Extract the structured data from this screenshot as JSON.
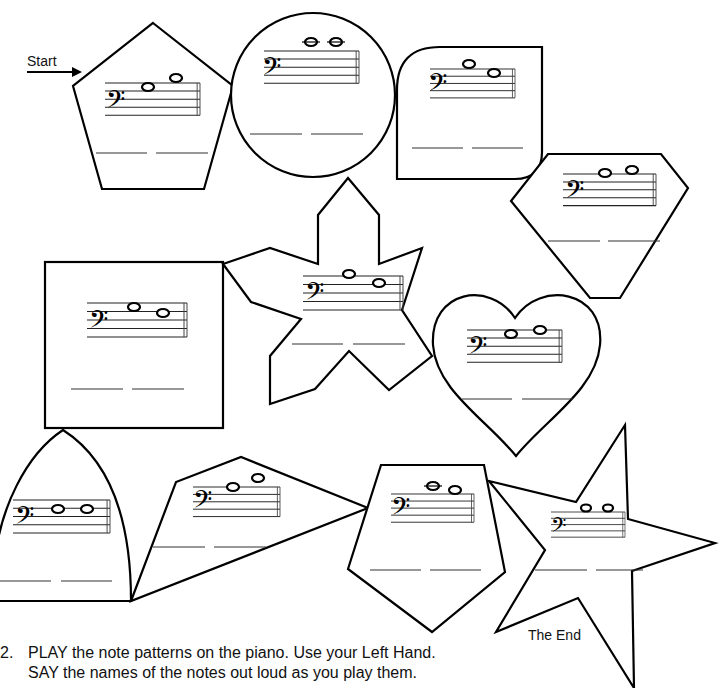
{
  "worksheet": {
    "start_label": "Start",
    "end_label": "The End",
    "clef": "bass",
    "clef_glyph": "𝄢",
    "accent_color": "#000000",
    "path_shapes": [
      {
        "id": 1,
        "shape": "pentagon",
        "notes": 2,
        "answer_blanks": 2
      },
      {
        "id": 2,
        "shape": "circle",
        "notes": 2,
        "answer_blanks": 2
      },
      {
        "id": 3,
        "shape": "rounded-square",
        "notes": 2,
        "answer_blanks": 2
      },
      {
        "id": 4,
        "shape": "diamond-gem",
        "notes": 2,
        "answer_blanks": 2
      },
      {
        "id": 5,
        "shape": "square",
        "notes": 2,
        "answer_blanks": 2
      },
      {
        "id": 6,
        "shape": "six-point-star",
        "notes": 2,
        "answer_blanks": 2
      },
      {
        "id": 7,
        "shape": "heart",
        "notes": 2,
        "answer_blanks": 2
      },
      {
        "id": 8,
        "shape": "arch",
        "notes": 2,
        "answer_blanks": 2
      },
      {
        "id": 9,
        "shape": "kite",
        "notes": 2,
        "answer_blanks": 2
      },
      {
        "id": 10,
        "shape": "pentagon",
        "notes": 2,
        "answer_blanks": 2
      },
      {
        "id": 11,
        "shape": "star",
        "notes": 2,
        "answer_blanks": 2
      }
    ]
  },
  "instructions": {
    "number": "2.",
    "line1": "PLAY the note patterns on the piano.  Use your Left Hand.",
    "line2": "SAY the names of the notes out loud as you play them."
  }
}
